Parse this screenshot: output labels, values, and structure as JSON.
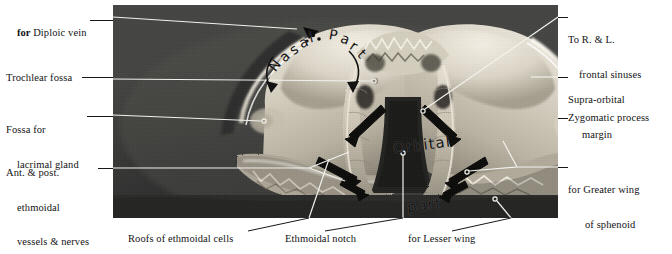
{
  "plate": {
    "title": "Frontal bone, inferior aspect",
    "photo": {
      "caption": "black-and-white photograph of a frontal bone viewed from below",
      "bone_color": "#d8d3c6",
      "background_color": "#343432"
    }
  },
  "in_photo_labels": [
    {
      "id": "nasal-part",
      "text": "Nasal Part",
      "letters": [
        "N",
        "a",
        "s",
        "a",
        "l",
        " ",
        "P",
        "a",
        "r",
        "t"
      ]
    },
    {
      "id": "orbital-part",
      "line1": "Orbital",
      "line2": "part"
    }
  ],
  "labels_left": [
    {
      "id": "diploic-vein",
      "bold_prefix": "for ",
      "text": "Diploic vein"
    },
    {
      "id": "trochlear-fossa",
      "text": "Trochlear fossa"
    },
    {
      "id": "lacrimal-fossa",
      "line1": "Fossa for",
      "line2": "lacrimal gland"
    },
    {
      "id": "ethmoidal-vessels",
      "line1": "Ant. & post.",
      "line2": "ethmoidal",
      "line3": "vessels & nerves"
    }
  ],
  "labels_right": [
    {
      "id": "frontal-sinuses",
      "line1": "To R. & L.",
      "line2": "frontal sinuses"
    },
    {
      "id": "supra-orbital-margin",
      "line1": "Supra-orbital",
      "line2": "margin"
    },
    {
      "id": "zygomatic-process",
      "line1": "Zygomatic process"
    },
    {
      "id": "greater-wing",
      "line1": "for Greater wing",
      "line2": "of sphenoid"
    }
  ],
  "labels_bottom": [
    {
      "id": "ethmoidal-cells",
      "text": "Roofs of ethmoidal cells"
    },
    {
      "id": "ethmoidal-notch",
      "text": "Ethmoidal notch"
    },
    {
      "id": "lesser-wing",
      "text": "for Lesser wing"
    }
  ],
  "colors": {
    "text": "#131313",
    "leader": "#171717",
    "leader_in_photo": "#f2f2ee",
    "arrow_marker": "#0d0d0d"
  }
}
